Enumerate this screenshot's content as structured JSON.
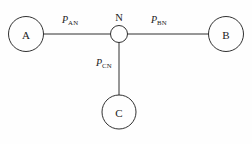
{
  "diagram": {
    "type": "network-topology",
    "background_color": "#fefefe",
    "stroke_color": "#1a1a1a",
    "nodes": [
      {
        "id": "A",
        "label": "A",
        "cx": 26,
        "cy": 34,
        "r": 17.5,
        "kind": "terminal"
      },
      {
        "id": "B",
        "label": "B",
        "cx": 226,
        "cy": 34,
        "r": 17.5,
        "kind": "terminal"
      },
      {
        "id": "C",
        "label": "C",
        "cx": 119,
        "cy": 112,
        "r": 17.0,
        "kind": "terminal"
      },
      {
        "id": "N",
        "label": "N",
        "cx": 119,
        "cy": 34,
        "r": 8.5,
        "kind": "hub"
      }
    ],
    "edges": [
      {
        "id": "AN",
        "from": "A",
        "to": "N",
        "symbol": "P",
        "subscript": "AN",
        "x1": 43.5,
        "y1": 34,
        "x2": 110.5,
        "y2": 34
      },
      {
        "id": "BN",
        "from": "N",
        "to": "B",
        "symbol": "P",
        "subscript": "BN",
        "x1": 127.5,
        "y1": 34,
        "x2": 208.5,
        "y2": 34
      },
      {
        "id": "CN",
        "from": "N",
        "to": "C",
        "symbol": "P",
        "subscript": "CN",
        "x1": 119,
        "y1": 42.5,
        "x2": 119,
        "y2": 95
      }
    ]
  }
}
